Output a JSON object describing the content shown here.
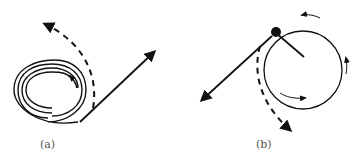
{
  "figure": {
    "panels": [
      {
        "id": "a",
        "label": "(a)"
      },
      {
        "id": "b",
        "label": "(b)"
      }
    ],
    "colors": {
      "ink": "#111111",
      "label": "#555555",
      "background": "#ffffff"
    }
  }
}
